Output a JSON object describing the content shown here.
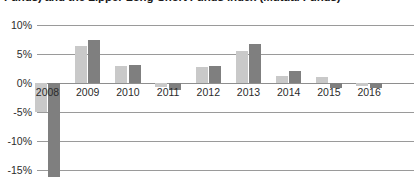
{
  "chart_data": {
    "type": "bar",
    "title": "Funds) and the Lipper Long-Short Funds Index (Mutual Funds)",
    "xlabel": "",
    "ylabel": "",
    "ylim": [
      -15,
      10
    ],
    "y_tick_labels": [
      "10%",
      "5%",
      "0%",
      "-5%",
      "-10%",
      "-15%"
    ],
    "y_tick_values": [
      10,
      5,
      0,
      -5,
      -10,
      -15
    ],
    "grid": true,
    "legend_position": "none",
    "categories": [
      "2008",
      "2009",
      "2010",
      "2011",
      "2012",
      "2013",
      "2014",
      "2015",
      "2016"
    ],
    "series": [
      {
        "name": "series-a",
        "color": "#c9c9c9",
        "values": [
          -5.0,
          6.3,
          3.0,
          -0.7,
          2.7,
          5.6,
          1.2,
          1.0,
          -0.5
        ]
      },
      {
        "name": "series-b",
        "color": "#7f7f7f",
        "values": [
          -19.0,
          7.4,
          3.1,
          -1.2,
          3.0,
          6.7,
          2.0,
          -0.8,
          -0.8
        ]
      }
    ]
  },
  "colors": {
    "series_a": "#c9c9c9",
    "series_b": "#7f7f7f",
    "gridline": "#9a9a9a",
    "text": "#2b2b2b",
    "title_text": "#1a1a1a",
    "background": "#ffffff"
  }
}
